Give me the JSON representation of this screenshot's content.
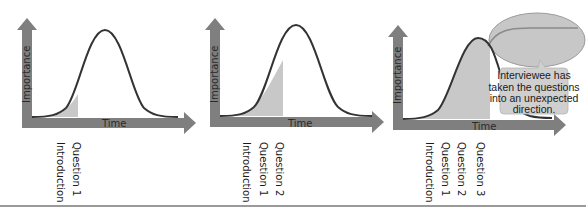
{
  "colors": {
    "axis": "#7f7f7f",
    "curve": "#333333",
    "shade": "#c8c8c8",
    "highlight_ellipse": "#bdbdbd",
    "callout_fill": "#cfcfcf",
    "background": "#ffffff"
  },
  "panels": [
    {
      "y_axis_label": "Importance",
      "x_axis_label": "Time",
      "ticks": [
        "Introduction",
        "Question 1"
      ]
    },
    {
      "y_axis_label": "Importance",
      "x_axis_label": "Time",
      "ticks": [
        "Introduction",
        "Question 1",
        "Question 2"
      ]
    },
    {
      "y_axis_label": "Importance",
      "x_axis_label": "Time",
      "ticks": [
        "Introduction",
        "Question 1",
        "Question 2",
        "Question 3"
      ],
      "callout": {
        "lines": [
          "Interviewee has",
          "taken the questions",
          "into an unexpected",
          "direction."
        ]
      }
    }
  ]
}
